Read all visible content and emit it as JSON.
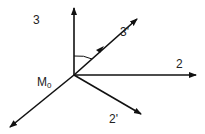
{
  "diagram": {
    "origin_label": "M",
    "origin_subscript": "0",
    "axes": [
      {
        "id": "axis-3",
        "label": "3",
        "direction": "up"
      },
      {
        "id": "axis-3-prime",
        "label": "3'",
        "direction": "up-right"
      },
      {
        "id": "axis-2",
        "label": "2",
        "direction": "right"
      },
      {
        "id": "axis-2-prime",
        "label": "2'",
        "direction": "down-right"
      },
      {
        "id": "axis-lower-left",
        "label": "",
        "direction": "down-left"
      }
    ],
    "angle_marker": "angle between axis 3 and axis 3'",
    "line_color": "#111111"
  }
}
